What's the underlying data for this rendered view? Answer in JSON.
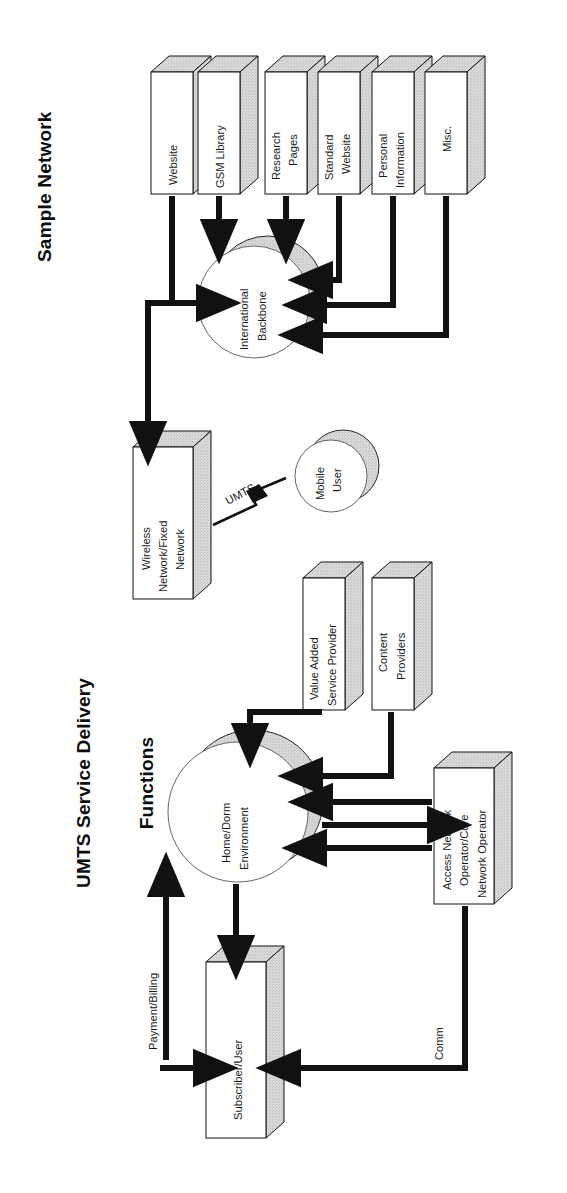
{
  "page": {
    "width": 567,
    "height": 1193,
    "background": "#ffffff",
    "ink": "#111111",
    "shade_fill": "#d9d9d9",
    "face_fill": "#ffffff",
    "orientation": "figures rotated 90 degrees counter-clockwise on the page"
  },
  "figures": [
    {
      "id": "sample-network",
      "title": "Sample Network",
      "type": "network-block-diagram",
      "nodes": [
        {
          "id": "website",
          "shape": "box-3d",
          "label": "Website"
        },
        {
          "id": "gsm-library",
          "shape": "box-3d",
          "label": "GSM Library"
        },
        {
          "id": "research-pages",
          "shape": "box-3d",
          "label": "Research\nPages"
        },
        {
          "id": "standard-website",
          "shape": "box-3d",
          "label": "Standard\nWebsite"
        },
        {
          "id": "personal-information",
          "shape": "box-3d",
          "label": "Personal\nInformation"
        },
        {
          "id": "misc",
          "shape": "box-3d",
          "label": "Misc."
        },
        {
          "id": "international-backbone",
          "shape": "circle-shadow",
          "label": "International\nBackbone"
        },
        {
          "id": "wireless-fixed-network",
          "shape": "box-3d",
          "label": "Wireless\nNetwork/Fixed\nNetwork"
        },
        {
          "id": "mobile-user",
          "shape": "circle-shadow",
          "label": "Mobile\nUser"
        }
      ],
      "edges": [
        {
          "from": "gsm-library",
          "to": "international-backbone",
          "style": "solid-arrow"
        },
        {
          "from": "research-pages",
          "to": "international-backbone",
          "style": "solid-arrow"
        },
        {
          "from": "standard-website",
          "to": "international-backbone",
          "style": "solid-arrow"
        },
        {
          "from": "personal-information",
          "to": "international-backbone",
          "style": "solid-arrow"
        },
        {
          "from": "misc",
          "to": "international-backbone",
          "style": "solid-arrow"
        },
        {
          "from": "website",
          "to": "international-backbone",
          "style": "solid-arrow"
        },
        {
          "from": "international-backbone",
          "to": "wireless-fixed-network",
          "style": "solid-arrow"
        },
        {
          "from": "wireless-fixed-network",
          "to": "mobile-user",
          "style": "lightning",
          "label": "UMTS"
        }
      ],
      "edge_labels": [
        "UMTS"
      ]
    },
    {
      "id": "umts-service-delivery",
      "title": "UMTS Service Delivery\nFunctions",
      "title_lines": [
        "UMTS Service Delivery",
        "Functions"
      ],
      "type": "network-block-diagram",
      "nodes": [
        {
          "id": "value-added-service-provider",
          "shape": "box-3d",
          "label": "Value Added\nService Provider"
        },
        {
          "id": "content-providers",
          "shape": "box-3d",
          "label": "Content\nProviders"
        },
        {
          "id": "home-dorm-environment",
          "shape": "circle-shadow",
          "label": "Home/Dorm\nEnvironment"
        },
        {
          "id": "access-network-operator",
          "shape": "box-3d",
          "label": "Access Network\nOperator/Core\nNetwork Operator"
        },
        {
          "id": "subscriber-user",
          "shape": "box-3d",
          "label": "Subscriber/User"
        }
      ],
      "edges": [
        {
          "from": "value-added-service-provider",
          "to": "home-dorm-environment",
          "style": "solid-arrow"
        },
        {
          "from": "content-providers",
          "to": "home-dorm-environment",
          "style": "solid-arrow"
        },
        {
          "from": "access-network-operator",
          "to": "home-dorm-environment",
          "style": "solid-arrow"
        },
        {
          "from": "home-dorm-environment",
          "to": "access-network-operator",
          "style": "solid-arrow"
        },
        {
          "from": "access-network-operator",
          "to": "home-dorm-environment",
          "style": "solid-arrow"
        },
        {
          "from": "home-dorm-environment",
          "to": "subscriber-user",
          "style": "solid-arrow"
        },
        {
          "from": "subscriber-user",
          "to": "home-dorm-environment",
          "style": "solid-arrow",
          "label": "Payment/Billing"
        },
        {
          "from": "access-network-operator",
          "to": "subscriber-user",
          "style": "solid-arrow",
          "label": "Comm"
        }
      ],
      "edge_labels": [
        "Payment/Billing",
        "Comm"
      ]
    }
  ],
  "labels": {
    "title_sample_network": "Sample Network",
    "title_umts_line1": "UMTS Service Delivery",
    "title_umts_line2": "Functions",
    "website": "Website",
    "gsm_library": "GSM Library",
    "research_l1": "Research",
    "research_l2": "Pages",
    "standard_l1": "Standard",
    "standard_l2": "Website",
    "personal_l1": "Personal",
    "personal_l2": "Information",
    "misc": "Misc.",
    "backbone_l1": "International",
    "backbone_l2": "Backbone",
    "wireless_l1": "Wireless",
    "wireless_l2": "Network/Fixed",
    "wireless_l3": "Network",
    "mobile_l1": "Mobile",
    "mobile_l2": "User",
    "umts_link": "UMTS",
    "vasp_l1": "Value Added",
    "vasp_l2": "Service Provider",
    "content_l1": "Content",
    "content_l2": "Providers",
    "homedorm_l1": "Home/Dorm",
    "homedorm_l2": "Environment",
    "ano_l1": "Access Network",
    "ano_l2": "Operator/Core",
    "ano_l3": "Network Operator",
    "subscriber": "Subscriber/User",
    "payment_billing": "Payment/Billing",
    "comm": "Comm"
  }
}
